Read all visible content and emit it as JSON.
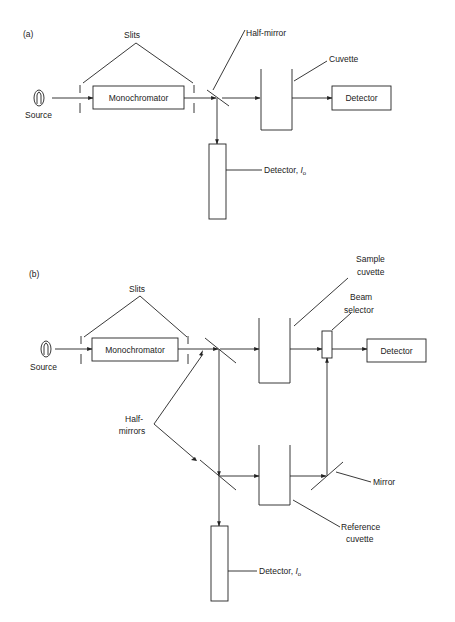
{
  "panel_a": {
    "label": "(a)",
    "slits_label": "Slits",
    "source_label": "Source",
    "monochromator_label": "Monochromator",
    "half_mirror_label": "Half-mirror",
    "cuvette_label": "Cuvette",
    "detector_label": "Detector",
    "reference_detector_label": "Detector,",
    "reference_detector_symbol": "I",
    "reference_detector_subscript": "o"
  },
  "panel_b": {
    "label": "(b)",
    "slits_label": "Slits",
    "source_label": "Source",
    "monochromator_label": "Monochromator",
    "sample_cuvette_label_1": "Sample",
    "sample_cuvette_label_2": "cuvette",
    "beam_selector_label_1": "Beam",
    "beam_selector_label_2": "selector",
    "detector_label": "Detector",
    "half_mirrors_label_1": "Half-",
    "half_mirrors_label_2": "mirrors",
    "mirror_label": "Mirror",
    "reference_cuvette_label_1": "Reference",
    "reference_cuvette_label_2": "cuvette",
    "reference_detector_label": "Detector,",
    "reference_detector_symbol": "I",
    "reference_detector_subscript": "o"
  },
  "colors": {
    "ink": "#222222",
    "background": "#ffffff"
  }
}
